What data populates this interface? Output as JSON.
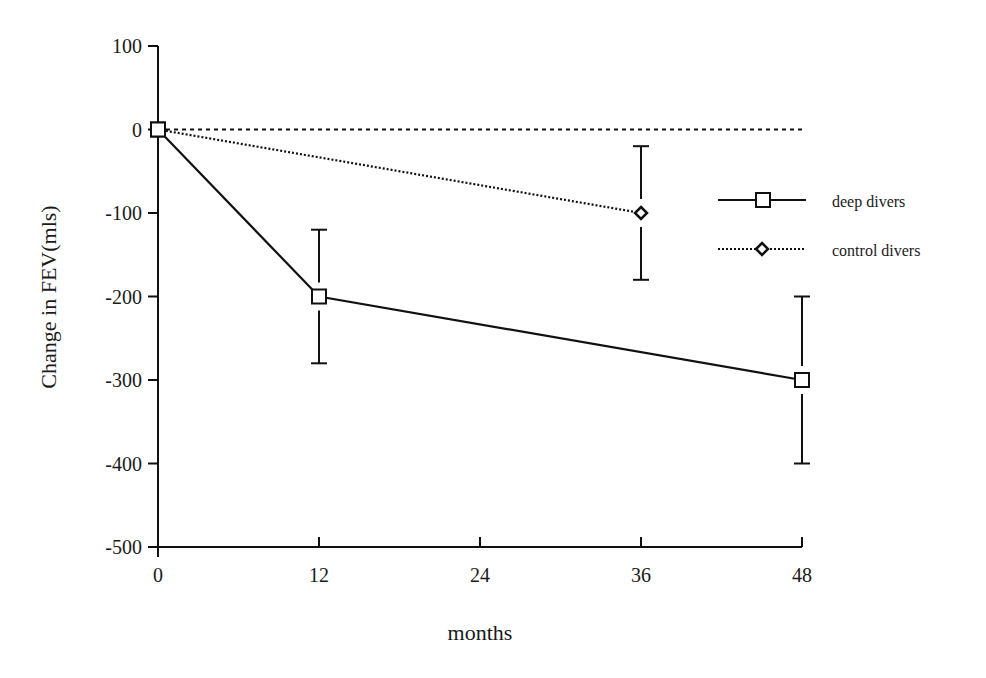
{
  "chart_data": {
    "type": "line",
    "title": "",
    "xlabel": "months",
    "ylabel": "Change in FEV(mls)",
    "xlim": [
      0,
      48
    ],
    "ylim": [
      -500,
      100
    ],
    "x_ticks": [
      0,
      12,
      24,
      36,
      48
    ],
    "y_ticks": [
      100,
      0,
      -100,
      -200,
      -300,
      -400,
      -500
    ],
    "x_tick_labels": [
      "0",
      "12",
      "24",
      "36",
      "48"
    ],
    "y_tick_labels": [
      "100",
      "0",
      "-100",
      "-200",
      "-300",
      "-400",
      "-500"
    ],
    "grid": false,
    "reference_line": {
      "y": 0,
      "style": "dashed"
    },
    "legend_position": "right",
    "series": [
      {
        "name": "deep divers",
        "marker": "square",
        "line_style": "solid",
        "x": [
          0,
          12,
          48
        ],
        "values": [
          0,
          -200,
          -300
        ],
        "error_low": [
          null,
          -280,
          -400
        ],
        "error_high": [
          null,
          -120,
          -200
        ]
      },
      {
        "name": "control divers",
        "marker": "diamond",
        "line_style": "dotted",
        "x": [
          0,
          36
        ],
        "values": [
          0,
          -100
        ],
        "error_low": [
          null,
          -180
        ],
        "error_high": [
          null,
          -20
        ]
      }
    ]
  },
  "legend": {
    "items": [
      {
        "label": "deep divers"
      },
      {
        "label": "control divers"
      }
    ]
  },
  "axes": {
    "xlabel": "months",
    "ylabel": "Change in FEV(mls)"
  }
}
